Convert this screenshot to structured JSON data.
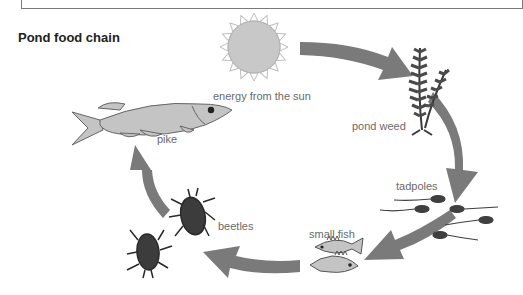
{
  "title": "Pond food chain",
  "labels": {
    "sun": "energy from the sun",
    "pond_weed": "pond weed",
    "tadpoles": "tadpoles",
    "small_fish": "small fish",
    "beetles": "beetles",
    "pike": "pike"
  },
  "chain": [
    "energy from the sun",
    "pond weed",
    "tadpoles",
    "small fish",
    "beetles",
    "pike"
  ],
  "colors": {
    "arrow": "#7a7a7a",
    "sun": "#c8c8c8",
    "fish": "#c4c4c4",
    "dark": "#3a3a3a",
    "label": "#6a6a6a"
  }
}
